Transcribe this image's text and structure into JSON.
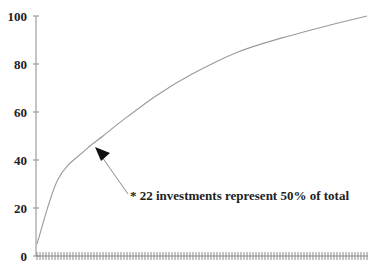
{
  "chart_data": {
    "type": "line",
    "title": "",
    "xlabel": "",
    "ylabel": "",
    "ylim": [
      0,
      100
    ],
    "yticks": [
      0,
      20,
      40,
      60,
      80,
      100
    ],
    "x_tick_count": 110,
    "x_tick_labels": [],
    "grid": false,
    "legend": null,
    "series": [
      {
        "name": "Cumulative % of total",
        "x": [
          0,
          7,
          16,
          22,
          28,
          40,
          52,
          67,
          82,
          100,
          110
        ],
        "values": [
          5,
          32,
          44,
          50,
          56,
          67,
          76,
          85,
          91,
          97,
          100
        ]
      }
    ],
    "annotations": [
      {
        "text": "* 22 investments represent 50% of total",
        "arrow_to": {
          "x": 22,
          "y": 50
        }
      }
    ]
  },
  "axis": {
    "y_labels": [
      "100",
      "80",
      "60",
      "40",
      "20",
      "0"
    ]
  },
  "annotation": {
    "text": "* 22 investments represent 50% of total"
  },
  "colors": {
    "curve": "#9a9a9a",
    "axis": "#8a8a8a",
    "text": "#222222"
  }
}
